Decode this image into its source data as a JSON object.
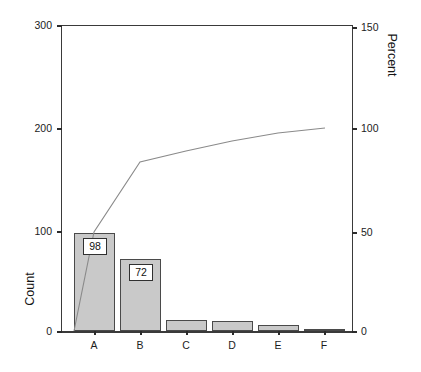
{
  "chart_data": {
    "type": "bar",
    "title": "",
    "subtitle": "",
    "categories": [
      "A",
      "B",
      "C",
      "D",
      "E",
      "F"
    ],
    "values": [
      98,
      72,
      11,
      10,
      6,
      1
    ],
    "bar_labels": [
      "98",
      "72",
      "",
      "",
      "",
      ""
    ],
    "series": [
      {
        "name": "Count",
        "type": "bar",
        "values": [
          98,
          72,
          11,
          10,
          6,
          1
        ],
        "axis": "left"
      },
      {
        "name": "Cumulative Percent",
        "type": "line",
        "values": [
          49.5,
          85.9,
          91.4,
          96.5,
          99.5,
          100.0
        ],
        "axis": "right"
      }
    ],
    "xlabel": "",
    "ylabel": "Count",
    "y2label": "Percent",
    "ylim": [
      0,
      300
    ],
    "y2lim": [
      0,
      150
    ],
    "yticks": [
      0,
      100,
      200,
      300
    ],
    "ytick_labels": [
      "0",
      "100",
      "200",
      "300"
    ],
    "y2ticks": [
      0,
      50,
      100,
      150
    ],
    "y2tick_labels": [
      "0",
      "50",
      "100",
      "150"
    ],
    "grid": false,
    "legend": "none",
    "colors": {
      "bar_fill": "#c9c9c9",
      "bar_edge": "#4a4a4a",
      "line": "#8a8a8a",
      "axis": "#3a3a3a",
      "text": "#1a1a1a",
      "background": "#ffffff"
    }
  },
  "axes": {
    "left": {
      "title": "Count",
      "ticks": [
        {
          "label": "300",
          "top": 20
        },
        {
          "label": "200",
          "top": 123
        },
        {
          "label": "100",
          "top": 226
        },
        {
          "label": "0",
          "top": 326
        }
      ]
    },
    "right": {
      "title": "Percent",
      "ticks": [
        {
          "label": "150",
          "top": 22
        },
        {
          "label": "100",
          "top": 123
        },
        {
          "label": "50",
          "top": 227
        },
        {
          "label": "0",
          "top": 326
        }
      ]
    },
    "bottom": {
      "ticks": [
        {
          "label": "A",
          "center": 94
        },
        {
          "label": "B",
          "center": 140
        },
        {
          "label": "C",
          "center": 186
        },
        {
          "label": "D",
          "center": 232
        },
        {
          "label": "E",
          "center": 278
        },
        {
          "label": "F",
          "center": 324
        }
      ]
    }
  },
  "bars": [
    {
      "category": "A",
      "value": 98,
      "label": "98",
      "left": 74,
      "width": 41,
      "top": 233,
      "height": 98,
      "label_left": 83,
      "label_top": 238,
      "label_width": 24
    },
    {
      "category": "B",
      "value": 72,
      "label": "72",
      "left": 120,
      "width": 41,
      "top": 259,
      "height": 72,
      "label_left": 129,
      "label_top": 264,
      "label_width": 24
    },
    {
      "category": "C",
      "value": 11,
      "label": "",
      "left": 166,
      "width": 41,
      "top": 320,
      "height": 11,
      "label_left": 0,
      "label_top": 0,
      "label_width": 0
    },
    {
      "category": "D",
      "value": 10,
      "label": "",
      "left": 212,
      "width": 41,
      "top": 321,
      "height": 10,
      "label_left": 0,
      "label_top": 0,
      "label_width": 0
    },
    {
      "category": "E",
      "value": 6,
      "label": "",
      "left": 258,
      "width": 41,
      "top": 325,
      "height": 6,
      "label_left": 0,
      "label_top": 0,
      "label_width": 0
    },
    {
      "category": "F",
      "value": 1,
      "label": "",
      "left": 304,
      "width": 41,
      "top": 329,
      "height": 2,
      "label_left": 0,
      "label_top": 0,
      "label_width": 0
    }
  ],
  "cumulative_line": {
    "points": "74,331 94,232 140,162 186,151 232,141 278,133 325,128",
    "color": "#8a8a8a"
  }
}
